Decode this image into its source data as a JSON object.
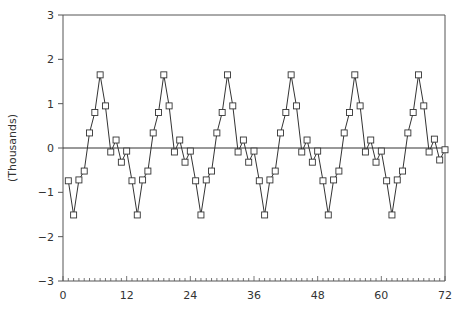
{
  "chart_data": {
    "type": "line",
    "title": "",
    "xlabel": "",
    "ylabel": "(Thousands)",
    "xlim": [
      0,
      72
    ],
    "ylim": [
      -3,
      3
    ],
    "x_ticks": [
      0,
      12,
      24,
      36,
      48,
      60,
      72
    ],
    "x_minor_tick_step": 1,
    "y_ticks": [
      -3,
      -2,
      -1,
      0,
      1,
      2,
      3
    ],
    "grid": false,
    "zero_line": true,
    "legend": null,
    "marker": "square",
    "series": [
      {
        "name": "series",
        "x": [
          1,
          2,
          3,
          4,
          5,
          6,
          7,
          8,
          9,
          10,
          11,
          12,
          13,
          14,
          15,
          16,
          17,
          18,
          19,
          20,
          21,
          22,
          23,
          24,
          25,
          26,
          27,
          28,
          29,
          30,
          31,
          32,
          33,
          34,
          35,
          36,
          37,
          38,
          39,
          40,
          41,
          42,
          43,
          44,
          45,
          46,
          47,
          48,
          49,
          50,
          51,
          52,
          53,
          54,
          55,
          56,
          57,
          58,
          59,
          60,
          61,
          62,
          63,
          64,
          65,
          66,
          67,
          68,
          69,
          70,
          71,
          72
        ],
        "values": [
          -0.74,
          -1.51,
          -0.72,
          -0.52,
          0.34,
          0.8,
          1.65,
          0.95,
          -0.09,
          0.18,
          -0.32,
          -0.07,
          -0.74,
          -1.51,
          -0.72,
          -0.52,
          0.34,
          0.8,
          1.65,
          0.95,
          -0.09,
          0.18,
          -0.32,
          -0.07,
          -0.74,
          -1.51,
          -0.72,
          -0.52,
          0.34,
          0.8,
          1.65,
          0.95,
          -0.09,
          0.18,
          -0.32,
          -0.07,
          -0.74,
          -1.51,
          -0.72,
          -0.52,
          0.34,
          0.8,
          1.65,
          0.95,
          -0.09,
          0.18,
          -0.32,
          -0.07,
          -0.74,
          -1.51,
          -0.72,
          -0.52,
          0.34,
          0.8,
          1.65,
          0.95,
          -0.09,
          0.18,
          -0.32,
          -0.07,
          -0.74,
          -1.51,
          -0.72,
          -0.52,
          0.34,
          0.8,
          1.65,
          0.95,
          -0.09,
          0.2,
          -0.27,
          -0.04
        ]
      }
    ]
  },
  "colors": {
    "line": "#333333",
    "axis": "#555555",
    "marker_fill": "#ffffff"
  }
}
